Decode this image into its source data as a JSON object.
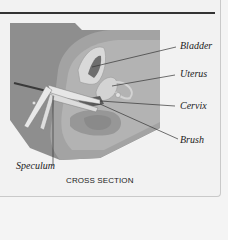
{
  "labels": {
    "bladder": "Bladder",
    "uterus": "Uterus",
    "cervix": "Cervix",
    "brush": "Brush",
    "speculum": "Speculum"
  },
  "caption": "CROSS SECTION",
  "colors": {
    "background": "#f2f2f2",
    "rule": "#333333",
    "tissue_dark": "#8c8c8c",
    "tissue_mid": "#a3a3a3",
    "tissue_light": "#bdbdbd",
    "organ_light": "#d6d6d6",
    "leader": "#333333"
  }
}
